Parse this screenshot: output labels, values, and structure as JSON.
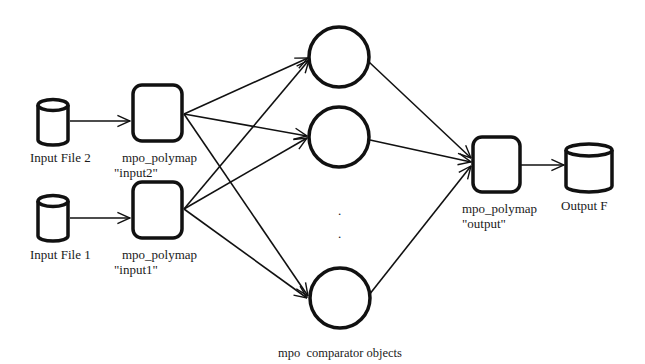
{
  "diagram": {
    "nodes": {
      "input_file_2": {
        "label": "Input File 2",
        "type": "data-store"
      },
      "input_file_1": {
        "label": "Input File 1",
        "type": "data-store"
      },
      "polymap_input2": {
        "label": "mpo_polymap",
        "sublabel": "\"input2\"",
        "type": "process"
      },
      "polymap_input1": {
        "label": "mpo_polymap",
        "sublabel": "\"input1\"",
        "type": "process"
      },
      "comparator_1": {
        "label": "",
        "type": "comparator"
      },
      "comparator_2": {
        "label": "",
        "type": "comparator"
      },
      "comparator_n": {
        "label": "",
        "type": "comparator"
      },
      "comparators_group": {
        "label": "mpo  comparator objects"
      },
      "ellipsis": {
        "label": "."
      },
      "polymap_output": {
        "label": "mpo_polymap",
        "sublabel": "\"output\"",
        "type": "process"
      },
      "output_file": {
        "label": "Output F",
        "type": "data-store"
      }
    },
    "edges": [
      {
        "from": "input_file_2",
        "to": "polymap_input2"
      },
      {
        "from": "input_file_1",
        "to": "polymap_input1"
      },
      {
        "from": "polymap_input2",
        "to": "comparator_1"
      },
      {
        "from": "polymap_input2",
        "to": "comparator_2"
      },
      {
        "from": "polymap_input2",
        "to": "comparator_n"
      },
      {
        "from": "polymap_input1",
        "to": "comparator_1"
      },
      {
        "from": "polymap_input1",
        "to": "comparator_2"
      },
      {
        "from": "polymap_input1",
        "to": "comparator_n"
      },
      {
        "from": "comparator_1",
        "to": "polymap_output"
      },
      {
        "from": "comparator_2",
        "to": "polymap_output"
      },
      {
        "from": "comparator_n",
        "to": "polymap_output"
      },
      {
        "from": "polymap_output",
        "to": "output_file"
      }
    ]
  }
}
